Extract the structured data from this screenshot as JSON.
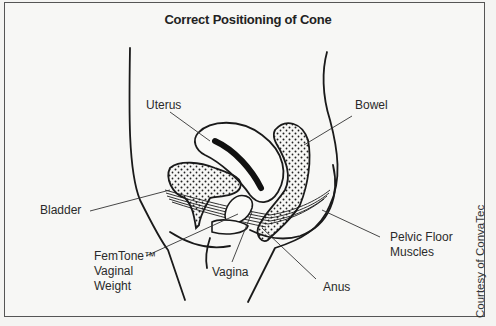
{
  "diagram": {
    "title": "Correct Positioning of Cone",
    "labels": {
      "uterus": "Uterus",
      "bowel": "Bowel",
      "bladder": "Bladder",
      "device_line1": "FemTone™",
      "device_line2": "Vaginal",
      "device_line3": "Weight",
      "vagina": "Vagina",
      "anus": "Anus",
      "pelvic_line1": "Pelvic Floor",
      "pelvic_line2": "Muscles"
    },
    "credit": "Courtesy of ConvaTec"
  }
}
